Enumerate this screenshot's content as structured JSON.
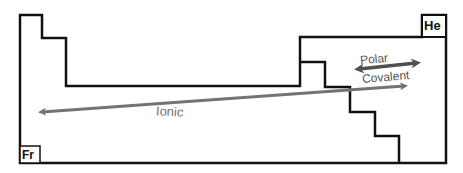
{
  "diagram": {
    "elements": {
      "top_right": "He",
      "bottom_left": "Fr"
    },
    "arrows": {
      "ionic": {
        "label": "Ionic",
        "color": "#707070",
        "direction": "right-to-left (double-headed implied toward left)"
      },
      "polar_covalent": {
        "label_line1": "Polar",
        "label_line2": "Covalent",
        "color": "#555555",
        "direction": "double-headed"
      }
    },
    "colors": {
      "outline": "#111111",
      "arrow_ionic": "#737373",
      "arrow_polar": "#505050",
      "text": "#606060"
    }
  }
}
